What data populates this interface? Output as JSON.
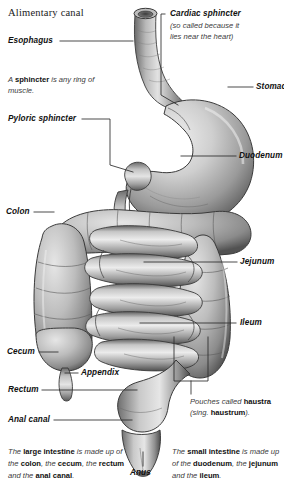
{
  "title": "Alimentary canal",
  "figure": {
    "name": "alimentary-canal-diagram",
    "organs": [
      "esophagus",
      "stomach",
      "duodenum",
      "jejunum",
      "ileum",
      "colon",
      "cecum",
      "appendix",
      "rectum",
      "anal-canal",
      "anus"
    ]
  },
  "labels": {
    "esophagus": "Esophagus",
    "cardiac_sphincter": "Cardiac sphincter",
    "stomach": "Stomach",
    "pyloric_sphincter": "Pyloric sphincter",
    "duodenum": "Duodenum",
    "colon": "Colon",
    "jejunum": "Jejunum",
    "ileum": "Ileum",
    "cecum": "Cecum",
    "appendix": "Appendix",
    "rectum": "Rectum",
    "anal_canal": "Anal canal",
    "anus": "Anus"
  },
  "notes": {
    "cardiac_sphincter_note_line1": "(so called because it",
    "cardiac_sphincter_note_line2": "lies near the heart)",
    "sphincter_note_pre": "A ",
    "sphincter_note_bold": "sphincter",
    "sphincter_note_post": " is any ring of muscle.",
    "haustra_pre": "Pouches called ",
    "haustra_bold": "haustra",
    "haustra_mid": " (sing. ",
    "haustra_bold2": "haustrum",
    "haustra_post": ")."
  },
  "captions": {
    "large_intestine": {
      "p1": "The ",
      "b1": "large intestine",
      "p2": " is made up of the ",
      "b2": "colon",
      "p3": ", the ",
      "b3": "cecum",
      "p4": ", the ",
      "b4": "rectum",
      "p5": " and the ",
      "b5": "anal canal",
      "p6": "."
    },
    "small_intestine": {
      "p1": "The ",
      "b1": "small intestine",
      "p2": " is made up of the ",
      "b2": "duodenum",
      "p3": ", the ",
      "b3": "jejunum",
      "p4": " and the ",
      "b4": "ileum",
      "p5": "."
    }
  },
  "colors": {
    "background": "#ffffff",
    "text": "#111111",
    "note_text": "#3b3b3b",
    "leader_line": "#2b2b2b",
    "organ_light": "#d8d8d8",
    "organ_mid": "#a9a9a9",
    "organ_dark": "#6e6e6e",
    "organ_shadow": "#4a4a4a"
  }
}
